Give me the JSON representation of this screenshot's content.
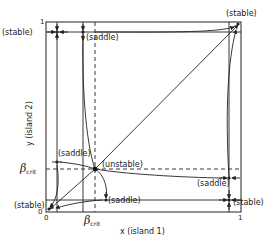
{
  "diagram": {
    "type": "phase-portrait",
    "axes": {
      "x_label": "x (island 1)",
      "y_label": "y (island 2)",
      "x_ticks": [
        "0",
        "1"
      ],
      "y_ticks": [
        "0",
        "1"
      ],
      "critical_label": "β",
      "critical_subscript": "crit"
    },
    "fixed_points": [
      {
        "label": "(stable)",
        "position": "top-left"
      },
      {
        "label": "(saddle)",
        "position": "top-inner"
      },
      {
        "label": "(stable)",
        "position": "top-right"
      },
      {
        "label": "(saddle)",
        "position": "left-inner"
      },
      {
        "label": "(unstable)",
        "position": "center"
      },
      {
        "label": "(saddle)",
        "position": "right-inner"
      },
      {
        "label": "(stable)",
        "position": "bottom-left"
      },
      {
        "label": "(saddle)",
        "position": "bottom-inner"
      },
      {
        "label": "(stable)",
        "position": "bottom-right"
      }
    ]
  }
}
